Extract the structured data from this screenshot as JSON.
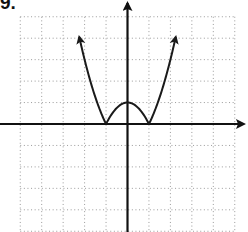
{
  "problem": {
    "label": "9."
  },
  "chart_data": {
    "type": "line",
    "title": "",
    "xlabel": "",
    "ylabel": "",
    "function": "y = |x^2 - 1|",
    "xlim": [
      -5,
      5
    ],
    "ylim": [
      -5,
      5
    ],
    "grid": true,
    "grid_spacing": 1,
    "legend": null,
    "series": [
      {
        "name": "f(x)",
        "x": [
          -2.25,
          -2,
          -1.5,
          -1,
          -0.5,
          0,
          0.5,
          1,
          1.5,
          2,
          2.25
        ],
        "values": [
          4.06,
          3,
          1.25,
          0,
          0.75,
          1,
          0.75,
          0,
          1.25,
          3,
          4.06
        ]
      }
    ],
    "x_intercepts": [
      -1,
      1
    ],
    "y_intercept": 1,
    "local_max": [
      0,
      1
    ],
    "end_behavior": "both ends increase without bound (arrows up)"
  },
  "colors": {
    "axis": "#111111",
    "curve": "#1a1a1a",
    "grid": "#9a9a9a",
    "background": "#ffffff"
  }
}
